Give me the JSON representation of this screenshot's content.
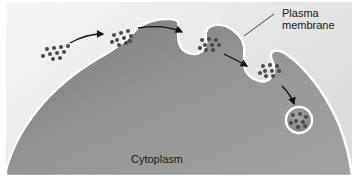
{
  "figure": {
    "labels": {
      "plasma_membrane_line1": "Plasma",
      "plasma_membrane_line2": "membrane",
      "cytoplasm": "Cytoplasm"
    },
    "stages": [
      {
        "name": "extracellular-particles",
        "particle_count": 10
      },
      {
        "name": "particles-at-membrane",
        "particle_count": 10
      },
      {
        "name": "invaginating-pit",
        "particle_count": 9
      },
      {
        "name": "budding-vesicle",
        "particle_count": 9
      },
      {
        "name": "free-vesicle",
        "particle_count": 8
      }
    ],
    "colors": {
      "background": "#f2f2f2",
      "cytoplasm": "#8c8c8c",
      "membrane": "#ffffff",
      "particle": "#4a4a4a",
      "arrow": "#111111"
    }
  }
}
